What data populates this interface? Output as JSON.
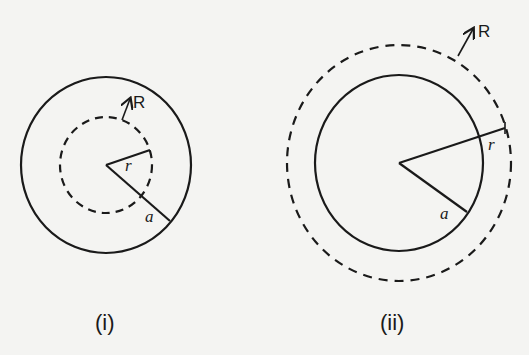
{
  "diagrams": [
    {
      "caption": "(i)",
      "outer_circle": {
        "style": "solid",
        "label": "a"
      },
      "inner_circle": {
        "style": "dashed",
        "label": "r"
      },
      "arrow_label": "R"
    },
    {
      "caption": "(ii)",
      "outer_circle": {
        "style": "dashed",
        "label": "r"
      },
      "inner_circle": {
        "style": "solid",
        "label": "a"
      },
      "arrow_label": "R"
    }
  ],
  "colors": {
    "stroke": "#1a1a1a",
    "background": "#f4f4f2"
  }
}
